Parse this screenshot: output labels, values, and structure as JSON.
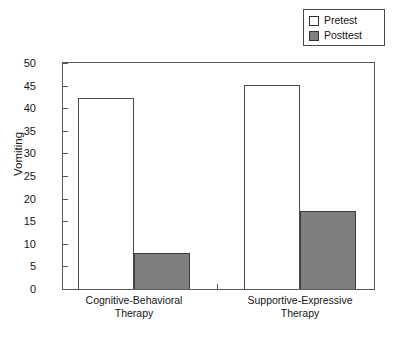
{
  "chart_data": {
    "type": "bar",
    "title": "",
    "xlabel": "",
    "ylabel": "Vomiting",
    "ylim": [
      0,
      50
    ],
    "ytick_step": 5,
    "yticks": [
      0,
      5,
      10,
      15,
      20,
      25,
      30,
      35,
      40,
      45,
      50
    ],
    "ytick_labels": [
      "0",
      "5",
      "10",
      "15",
      "20",
      "25",
      "30",
      "35",
      "40",
      "45",
      "50"
    ],
    "grid": false,
    "legend_position": "top-right",
    "categories": [
      "Cognitive-Behavioral Therapy",
      "Supportive-Expressive Therapy"
    ],
    "category_lines": [
      [
        "Cognitive-Behavioral",
        "Therapy"
      ],
      [
        "Supportive-Expressive",
        "Therapy"
      ]
    ],
    "series": [
      {
        "name": "Pretest",
        "values": [
          42.2,
          45.2
        ],
        "color": "#ffffff",
        "edge_color": "#4a4a4a"
      },
      {
        "name": "Posttest",
        "values": [
          7.9,
          17.3
        ],
        "color": "#807f80",
        "edge_color": "#3d3d3d"
      }
    ]
  },
  "legend": {
    "entries": [
      {
        "label": "Pretest",
        "swatch": "pretest"
      },
      {
        "label": "Posttest",
        "swatch": "posttest"
      }
    ]
  },
  "axis": {
    "y_title": "Vomiting"
  }
}
